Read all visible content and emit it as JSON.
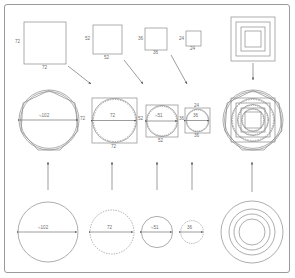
{
  "diagram": {
    "stroke_color": "#8a8a8a",
    "dark_stroke_color": "#6f6f6f",
    "label_color": "#6f6f6f",
    "frame_color": "#9a9a9a",
    "background": "#ffffff"
  },
  "row_top": {
    "name": "squares-row",
    "squares": [
      {
        "id": "square-72",
        "size_label_left": "72",
        "size_label_bottom": "72",
        "value": 72
      },
      {
        "id": "square-52",
        "size_label_left": "52",
        "size_label_bottom": "52",
        "value": 52
      },
      {
        "id": "square-36",
        "size_label_left": "36",
        "size_label_bottom": "36",
        "value": 36
      },
      {
        "id": "square-24",
        "size_label_left": "24",
        "size_label_bottom": "24",
        "value": 24
      }
    ],
    "nested_squares": {
      "id": "nested-squares-stack",
      "count": 4,
      "values": [
        72,
        52,
        36,
        24
      ]
    }
  },
  "row_middle": {
    "name": "combined-row",
    "items": [
      {
        "id": "circle-polygon-102",
        "diameter_label": "≈102",
        "side_label": "72",
        "value": 102
      },
      {
        "id": "square-circle-72",
        "diameter_label": "72",
        "square_bottom_label": "72",
        "side_label": "52",
        "value": 72
      },
      {
        "id": "square-circle-51",
        "diameter_label": "≈51",
        "square_bottom_label": "52",
        "side_label": "36",
        "value": 51
      },
      {
        "id": "square-circle-36",
        "diameter_label": "36",
        "square_bottom_label": "36",
        "top_label": "24",
        "value": 36
      }
    ],
    "composite": {
      "id": "composite-overlay",
      "description": "all squares, circles and polygons superimposed"
    }
  },
  "row_bottom": {
    "name": "circles-row",
    "circles": [
      {
        "id": "circle-102",
        "diameter_label": "≈102",
        "style": "solid",
        "value": 102
      },
      {
        "id": "circle-72",
        "diameter_label": "72",
        "style": "dashed",
        "value": 72
      },
      {
        "id": "circle-51",
        "diameter_label": "≈51",
        "style": "solid",
        "value": 51
      },
      {
        "id": "circle-36",
        "diameter_label": "36",
        "style": "dashed",
        "value": 36
      }
    ],
    "concentric": {
      "id": "concentric-circles",
      "count": 4,
      "values": [
        102,
        72,
        51,
        36
      ]
    }
  },
  "arrows": {
    "diagonal": [
      {
        "id": "arrow-square72-to-circle72"
      },
      {
        "id": "arrow-square52-to-circle51"
      },
      {
        "id": "arrow-square36-to-circle36"
      }
    ],
    "vertical_up": [
      {
        "id": "arrow-up-1"
      },
      {
        "id": "arrow-up-2"
      },
      {
        "id": "arrow-up-3"
      },
      {
        "id": "arrow-up-4"
      },
      {
        "id": "arrow-up-composite"
      }
    ],
    "vertical_down": [
      {
        "id": "arrow-down-nested-squares"
      }
    ]
  }
}
